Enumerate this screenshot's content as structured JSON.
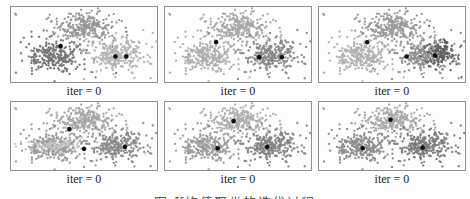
{
  "figure": {
    "background": "#ffffff",
    "panel_border_color": "#8f8f8f",
    "panel_bg": "#fdfdfd",
    "label_color": "#1b1b1b",
    "centroid_color": "#101010",
    "caption": "图 K均值聚类的迭代过程",
    "caption_color": "#555555"
  },
  "chart_data": {
    "type": "scatter",
    "title": "",
    "grid": [
      2,
      3
    ],
    "legend": "none",
    "axes": "none",
    "seed": 11,
    "point_radius": 1.15,
    "points_per_cluster": 270,
    "outliers_per_cluster": 18,
    "base_clusters": [
      {
        "name": "top",
        "cx": 0.5,
        "cy": 0.27,
        "sx": 0.095,
        "sy": 0.095
      },
      {
        "name": "left",
        "cx": 0.295,
        "cy": 0.655,
        "sx": 0.1,
        "sy": 0.1
      },
      {
        "name": "right",
        "cx": 0.725,
        "cy": 0.645,
        "sx": 0.095,
        "sy": 0.1
      }
    ],
    "subplots": [
      {
        "label": "iter = 0",
        "colors": [
          "#999999",
          "#787878",
          "#b5b5b5"
        ],
        "extra_clusters": [],
        "centroids": [
          [
            0.34,
            0.52
          ],
          [
            0.715,
            0.66
          ],
          [
            0.79,
            0.66
          ]
        ]
      },
      {
        "label": "iter = 0",
        "colors": [
          "#a9a9a9",
          "#b0b0b0",
          "#8a8a8a"
        ],
        "extra_clusters": [],
        "centroids": [
          [
            0.35,
            0.47
          ],
          [
            0.645,
            0.67
          ],
          [
            0.8,
            0.67
          ]
        ]
      },
      {
        "label": "iter = 0",
        "colors": [
          "#9c9c9c",
          "#b2b2b2",
          "#909090"
        ],
        "extra_clusters": [
          {
            "cx": 0.83,
            "cy": 0.62,
            "sx": 0.05,
            "sy": 0.085,
            "n": 110,
            "color": "#606060"
          }
        ],
        "centroids": [
          [
            0.33,
            0.47
          ],
          [
            0.6,
            0.66
          ],
          [
            0.795,
            0.65
          ]
        ]
      },
      {
        "label": "iter = 0",
        "colors": [
          "#a8a8a8",
          "#9c9c9c",
          "#8d8d8d"
        ],
        "extra_clusters": [
          {
            "cx": 0.3,
            "cy": 0.64,
            "sx": 0.1,
            "sy": 0.04,
            "n": 85,
            "color": "#c3c3c3"
          }
        ],
        "centroids": [
          [
            0.4,
            0.4
          ],
          [
            0.5,
            0.69
          ],
          [
            0.78,
            0.66
          ]
        ]
      },
      {
        "label": "iter = 0",
        "colors": [
          "#b1b1b1",
          "#9e9e9e",
          "#858585"
        ],
        "extra_clusters": [],
        "centroids": [
          [
            0.47,
            0.28
          ],
          [
            0.36,
            0.68
          ],
          [
            0.7,
            0.66
          ]
        ]
      },
      {
        "label": "iter = 0",
        "colors": [
          "#ababab",
          "#8f8f8f",
          "#7e7e7e"
        ],
        "extra_clusters": [],
        "centroids": [
          [
            0.49,
            0.26
          ],
          [
            0.3,
            0.68
          ],
          [
            0.71,
            0.67
          ]
        ]
      }
    ]
  }
}
